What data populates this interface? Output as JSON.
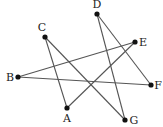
{
  "diagram": {
    "type": "star-polygon",
    "points": [
      {
        "label": "A",
        "x": 67,
        "y": 108,
        "lx": 67,
        "ly": 122,
        "anchor": "middle"
      },
      {
        "label": "B",
        "x": 18,
        "y": 77,
        "lx": 10,
        "ly": 81,
        "anchor": "middle"
      },
      {
        "label": "C",
        "x": 45,
        "y": 37,
        "lx": 42,
        "ly": 31,
        "anchor": "middle"
      },
      {
        "label": "D",
        "x": 97,
        "y": 14,
        "lx": 97,
        "ly": 8,
        "anchor": "middle"
      },
      {
        "label": "E",
        "x": 135,
        "y": 42,
        "lx": 143,
        "ly": 46,
        "anchor": "middle"
      },
      {
        "label": "F",
        "x": 151,
        "y": 85,
        "lx": 158,
        "ly": 89,
        "anchor": "middle"
      },
      {
        "label": "G",
        "x": 125,
        "y": 120,
        "lx": 134,
        "ly": 124,
        "anchor": "middle"
      }
    ],
    "edges": [
      [
        "C",
        "A"
      ],
      [
        "A",
        "E"
      ],
      [
        "E",
        "B"
      ],
      [
        "B",
        "F"
      ],
      [
        "F",
        "D"
      ],
      [
        "D",
        "G"
      ],
      [
        "G",
        "C"
      ]
    ],
    "line_color": "#555555",
    "dot_color": "#111111"
  }
}
